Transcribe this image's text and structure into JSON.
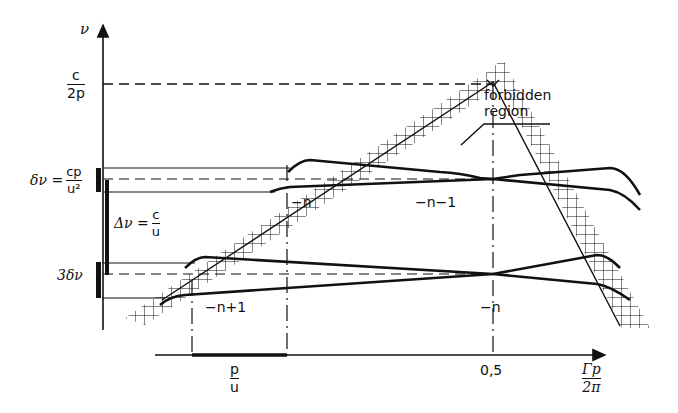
{
  "diagram": {
    "y_axis": {
      "label": "ν",
      "tick_c2p": {
        "num": "c",
        "den": "2p"
      }
    },
    "x_axis": {
      "label": {
        "num": "Γp",
        "den": "2π"
      },
      "tick_mid": "0,5",
      "tick_pu": {
        "num": "p",
        "den": "u"
      }
    },
    "left_annotations": {
      "delta_nu": {
        "lhs": "δν =",
        "num": "cp",
        "den": "u²"
      },
      "Delta_nu": {
        "lhs": "Δν =",
        "num": "c",
        "den": "u"
      },
      "three_delta": "3δν"
    },
    "branch_labels": {
      "upper_left": "−n",
      "upper_right": "−n−1",
      "lower_left": "−n+1",
      "lower_right": "−n"
    },
    "forbidden_label_line1": "forbidden",
    "forbidden_label_line2": "region",
    "colors": {
      "ink": "#111111",
      "background": "#ffffff"
    }
  }
}
